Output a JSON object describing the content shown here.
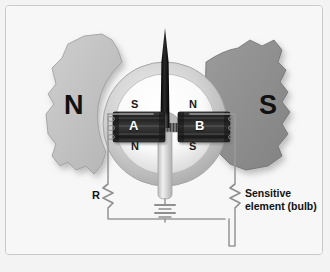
{
  "diagram": {
    "frame": {
      "border_color": "#c9c9c9",
      "background": "#f7f7f7"
    },
    "poles": [
      {
        "name": "north-pole",
        "label": "N",
        "fill": "#c2c2c2",
        "side": "left"
      },
      {
        "name": "south-pole",
        "label": "S",
        "fill": "#8f8f8f",
        "side": "right"
      }
    ],
    "rotor": {
      "housing_fill": "#cfcfcf",
      "inner_fill": "#ffffff",
      "polarity_labels": {
        "left_top": "S",
        "left_bottom": "N",
        "right_top": "N",
        "right_bottom": "S"
      },
      "magnets": [
        {
          "name": "magnet-a",
          "label": "A",
          "fill": "#2b2b2b"
        },
        {
          "name": "magnet-b",
          "label": "B",
          "fill": "#2b2b2b"
        }
      ],
      "needle": {
        "name": "pointer-needle",
        "color": "#111111"
      }
    },
    "circuit": {
      "wire_color": "#9a9a9a",
      "resistor": {
        "label": "R"
      },
      "battery": {
        "cells": 4
      },
      "sensitive_element": {
        "label_line1": "Sensitive",
        "label_line2": "element (bulb)"
      }
    },
    "colors": {
      "north_gray": "#c2c2c2",
      "south_gray": "#8f8f8f",
      "magnet_dark": "#2b2b2b",
      "wire": "#9a9a9a",
      "text": "#111111"
    }
  }
}
